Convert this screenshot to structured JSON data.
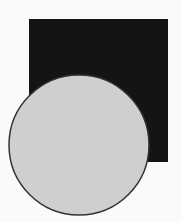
{
  "canvas": {
    "width": 181,
    "height": 222,
    "background": "#fafafa"
  },
  "shapes": {
    "square": {
      "x": 29,
      "y": 19,
      "width": 139,
      "height": 143,
      "fill": "#141414"
    },
    "circle": {
      "cx": 79,
      "cy": 145,
      "r": 70,
      "fill": "#cfcfcf",
      "stroke": "#333333",
      "stroke_width": 1.5
    }
  }
}
